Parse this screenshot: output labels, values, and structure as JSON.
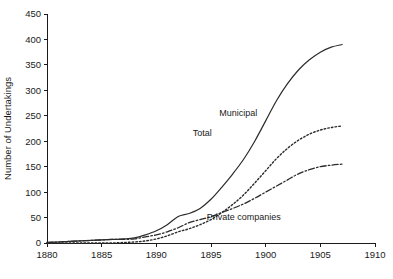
{
  "chart_data": {
    "type": "line",
    "title": "",
    "xlabel": "",
    "ylabel": "Number of Undertakings",
    "xlim": [
      1880,
      1910
    ],
    "ylim": [
      0,
      450
    ],
    "xticks": [
      1880,
      1885,
      1890,
      1895,
      1900,
      1905,
      1910
    ],
    "yticks": [
      0,
      50,
      100,
      150,
      200,
      250,
      300,
      350,
      400,
      450
    ],
    "grid": false,
    "legend": "inline-annotations",
    "x": [
      1880,
      1881,
      1882,
      1883,
      1884,
      1885,
      1886,
      1887,
      1888,
      1889,
      1890,
      1891,
      1892,
      1893,
      1894,
      1895,
      1896,
      1897,
      1898,
      1899,
      1900,
      1901,
      1902,
      1903,
      1904,
      1905,
      1906,
      1907
    ],
    "series": [
      {
        "name": "Total",
        "style": "solid",
        "label": "Total",
        "values": [
          1,
          2,
          3,
          4,
          5,
          6,
          7,
          8,
          10,
          16,
          24,
          36,
          52,
          58,
          68,
          86,
          110,
          136,
          165,
          200,
          240,
          280,
          313,
          340,
          360,
          375,
          385,
          390
        ]
      },
      {
        "name": "Municipal",
        "style": "dotted",
        "label": "Municipal",
        "values": [
          0,
          0,
          0,
          0,
          0,
          0,
          0,
          1,
          2,
          4,
          8,
          14,
          22,
          28,
          36,
          46,
          60,
          76,
          95,
          118,
          142,
          166,
          186,
          202,
          214,
          222,
          227,
          230
        ]
      },
      {
        "name": "Private companies",
        "style": "dash-dot",
        "label": "Private companies",
        "values": [
          1,
          2,
          3,
          4,
          5,
          6,
          7,
          7,
          8,
          12,
          16,
          22,
          30,
          40,
          46,
          52,
          60,
          68,
          77,
          88,
          100,
          112,
          124,
          136,
          144,
          150,
          153,
          155
        ]
      }
    ],
    "annotations": [
      {
        "text": "Total",
        "x": 1894.2,
        "y": 210
      },
      {
        "text": "Municipal",
        "x": 1897.5,
        "y": 250
      },
      {
        "text": "Private companies",
        "x": 1898.0,
        "y": 45
      }
    ],
    "colors": {
      "axis": "#1a1a1a",
      "series": "#2b2b2b",
      "background": "#ffffff"
    }
  }
}
